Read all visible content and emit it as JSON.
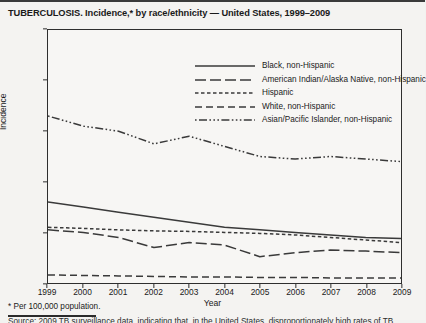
{
  "figure": {
    "title": "TUBERCULOSIS. Incidence,* by race/ethnicity — United States, 1999–2009",
    "footnote": "* Per 100,000 population.",
    "source_text": "Source: 2009 TB surveillance data, indicating that, in the United States, disproportionately high rates of TB"
  },
  "chart_data": {
    "type": "line",
    "title": "TUBERCULOSIS. Incidence,* by race/ethnicity — United States, 1999–2009",
    "xlabel": "Year",
    "ylabel": "Incidence",
    "x": [
      1999,
      2000,
      2001,
      2002,
      2003,
      2004,
      2005,
      2006,
      2007,
      2008,
      2009
    ],
    "xticklabels": [
      "1999",
      "2000",
      "2001",
      "2002",
      "2003",
      "2004",
      "2005",
      "2006",
      "2007",
      "2008",
      "2009"
    ],
    "yticklabels": [
      "0",
      "10",
      "20",
      "30",
      "40",
      "50"
    ],
    "yticks": [
      0,
      10,
      20,
      30,
      40,
      50
    ],
    "ylim": [
      0,
      50
    ],
    "xlim": [
      1999,
      2009
    ],
    "grid": false,
    "legend_position": "top-right-inside",
    "series": [
      {
        "name": "Black, non-Hispanic",
        "dash": "solid",
        "color": "#3a3a3a",
        "values": [
          16.0,
          15.0,
          14.0,
          13.0,
          12.0,
          11.0,
          10.5,
          10.0,
          9.5,
          9.0,
          8.8
        ]
      },
      {
        "name": "American Indian/Alaska Native, non-Hispanic",
        "dash": "long-dash",
        "color": "#3a3a3a",
        "values": [
          10.5,
          10.0,
          9.0,
          7.0,
          8.0,
          7.5,
          5.2,
          6.0,
          6.5,
          6.3,
          6.0
        ]
      },
      {
        "name": "Hispanic",
        "dash": "short-dash",
        "color": "#3a3a3a",
        "values": [
          11.0,
          10.8,
          10.5,
          10.3,
          10.2,
          10.0,
          9.8,
          9.5,
          9.0,
          8.5,
          8.0
        ]
      },
      {
        "name": "White, non-Hispanic",
        "dash": "medium-dash",
        "color": "#3a3a3a",
        "values": [
          1.6,
          1.5,
          1.4,
          1.3,
          1.2,
          1.2,
          1.1,
          1.1,
          1.0,
          1.0,
          1.0
        ]
      },
      {
        "name": "Asian/Pacific Islander, non-Hispanic",
        "dash": "dash-dot-dot",
        "color": "#3a3a3a",
        "values": [
          33.0,
          31.0,
          30.0,
          27.5,
          29.0,
          27.0,
          25.0,
          24.5,
          25.0,
          24.5,
          24.0
        ]
      }
    ]
  }
}
